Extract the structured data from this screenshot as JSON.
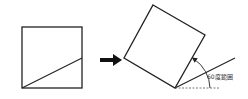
{
  "diagram": {
    "angle_label": "60度範囲",
    "colors": {
      "stroke": "#222222",
      "background": "#ffffff",
      "dashed": "#555555"
    },
    "left_square": {
      "x": 22,
      "y": 27,
      "size": 61
    },
    "arrow": {
      "direction": "right"
    },
    "rotated_square": {
      "vertices": [
        [
          153,
          5
        ],
        [
          205,
          35
        ],
        [
          175,
          88
        ],
        [
          124,
          58
        ]
      ]
    }
  }
}
